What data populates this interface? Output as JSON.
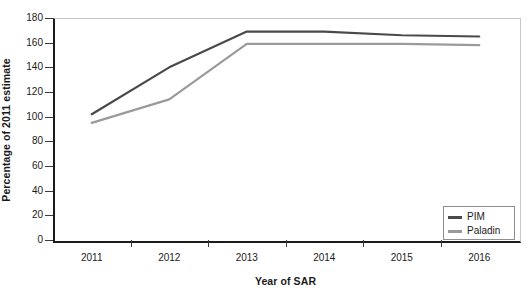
{
  "chart_data": {
    "type": "line",
    "title": "",
    "xlabel": "Year of SAR",
    "ylabel": "Percentage of 2011 estimate",
    "categories": [
      "2011",
      "2012",
      "2013",
      "2014",
      "2015",
      "2016"
    ],
    "x": [
      2011,
      2012,
      2013,
      2014,
      2015,
      2016
    ],
    "series": [
      {
        "name": "PIM",
        "color": "#4a4a4a",
        "values": [
          102,
          140,
          169,
          169,
          166,
          165
        ]
      },
      {
        "name": "Paladin",
        "color": "#9a9a9a",
        "values": [
          95,
          114,
          159,
          159,
          159,
          158
        ]
      }
    ],
    "ylim": [
      0,
      180
    ],
    "ytick_step": 20,
    "yticks": [
      0,
      20,
      40,
      60,
      80,
      100,
      120,
      140,
      160,
      180
    ],
    "ytick_labels": [
      "0",
      "20",
      "40",
      "60",
      "80",
      "100",
      "120",
      "140",
      "160",
      "180"
    ],
    "grid": false,
    "legend_position": "bottom-right",
    "legend_entries": [
      "PIM",
      "Paladin"
    ]
  },
  "axes": {
    "y_title": "Percentage of 2011 estimate",
    "x_title": "Year of SAR"
  },
  "legend": {
    "items": [
      {
        "label": "PIM",
        "color": "#4a4a4a"
      },
      {
        "label": "Paladin",
        "color": "#9a9a9a"
      }
    ]
  },
  "colors": {
    "pim": "#4a4a4a",
    "paladin": "#9a9a9a",
    "axis": "#1b1b1b",
    "frame": "#c9c9c9",
    "background": "#ffffff"
  }
}
